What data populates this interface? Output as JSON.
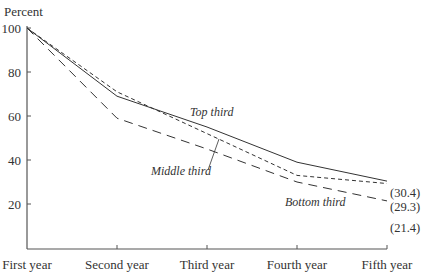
{
  "chart_data": {
    "type": "line",
    "title": "",
    "ylabel": "Percent",
    "xlabel": "",
    "categories": [
      "First year",
      "Second year",
      "Third year",
      "Fourth year",
      "Fifth year"
    ],
    "ylim": [
      0,
      100
    ],
    "yticks": [
      20,
      40,
      60,
      80,
      100
    ],
    "ytick_labels": [
      "20",
      "40",
      "60",
      "80",
      "100"
    ],
    "grid": false,
    "legend": "none (inline series labels)",
    "series": [
      {
        "name": "Top third",
        "style": "solid",
        "values": [
          100,
          69,
          55,
          39,
          30.4
        ],
        "end_label": "(30.4)"
      },
      {
        "name": "Middle third",
        "style": "short-dash",
        "values": [
          100,
          71,
          52,
          33,
          29.3
        ],
        "end_label": "(29.3)"
      },
      {
        "name": "Bottom third",
        "style": "long-dash",
        "values": [
          100,
          59,
          45,
          30,
          21.4
        ],
        "end_label": "(21.4)"
      }
    ],
    "colors": {
      "line": "#333333",
      "axis": "#555555",
      "text": "#333333"
    }
  }
}
